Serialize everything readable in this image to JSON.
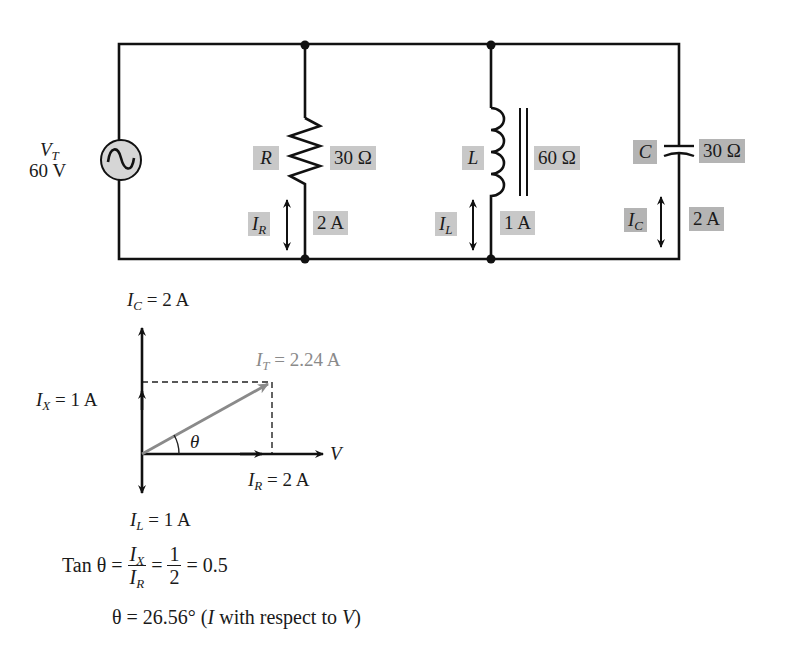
{
  "circuit": {
    "source": {
      "symbol": "V",
      "subscript": "T",
      "value": "60 V"
    },
    "resistor": {
      "symbol": "R",
      "impedance": "30 Ω",
      "current_symbol": "I",
      "current_subscript": "R",
      "current": "2 A"
    },
    "inductor": {
      "symbol": "L",
      "impedance": "60 Ω",
      "current_symbol": "I",
      "current_subscript": "L",
      "current": "1 A"
    },
    "capacitor": {
      "symbol": "C",
      "impedance": "30 Ω",
      "current_symbol": "I",
      "current_subscript": "C",
      "current": "2 A"
    }
  },
  "phasor": {
    "ic": {
      "symbol": "I",
      "subscript": "C",
      "rest": " = 2 A"
    },
    "ix": {
      "symbol": "I",
      "subscript": "X",
      "rest": " = 1 A"
    },
    "it": {
      "symbol": "I",
      "subscript": "T",
      "rest": " = 2.24 A"
    },
    "ir": {
      "symbol": "I",
      "subscript": "R",
      "rest": " = 2 A"
    },
    "il": {
      "symbol": "I",
      "subscript": "L",
      "rest": " = 1 A"
    },
    "v": "V",
    "theta": "θ"
  },
  "equations": {
    "line1": {
      "prefix": "Tan θ =",
      "frac1_num_sym": "I",
      "frac1_num_sub": "X",
      "frac1_den_sym": "I",
      "frac1_den_sub": "R",
      "eq": "=",
      "frac2_num": "1",
      "frac2_den": "2",
      "result": "= 0.5"
    },
    "line2": {
      "prefix": "θ = 26.56° (",
      "i": "I",
      "middle": " with respect to ",
      "v": "V",
      "suffix": ")"
    }
  },
  "colors": {
    "wire": "#111111",
    "label_box": "#c8c8c8",
    "label_box_dark": "#b4b4b4",
    "resultant_vector": "#8a8a8a"
  }
}
